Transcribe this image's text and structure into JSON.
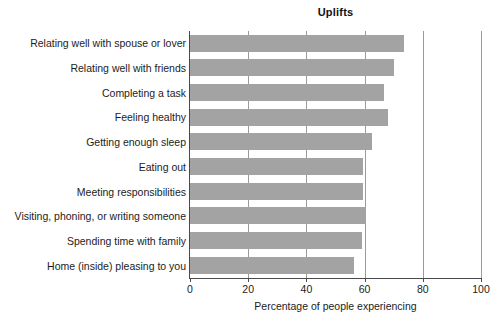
{
  "chart_data": {
    "type": "bar",
    "orientation": "horizontal",
    "title": "Uplifts",
    "xlabel": "Percentage of people experiencing",
    "ylabel": "",
    "xlim": [
      0,
      100
    ],
    "xticks": [
      0,
      20,
      40,
      60,
      80,
      100
    ],
    "xtick_labels": [
      "0",
      "20",
      "40",
      "60",
      "80",
      "100"
    ],
    "grid": true,
    "grid_axis": "x",
    "legend": null,
    "bar_color": "#a3a3a3",
    "axis_color": "#4a4a4a",
    "grid_color": "#9b9b9b",
    "categories": [
      "Relating well with spouse or lover",
      "Relating well with friends",
      "Completing a task",
      "Feeling healthy",
      "Getting enough sleep",
      "Eating out",
      "Meeting responsibilities",
      "Visiting, phoning, or writing someone",
      "Spending time with family",
      "Home (inside) pleasing to you"
    ],
    "values": [
      73.5,
      70,
      66.5,
      68,
      62.5,
      59.5,
      59.5,
      60.5,
      59,
      56.5
    ]
  }
}
